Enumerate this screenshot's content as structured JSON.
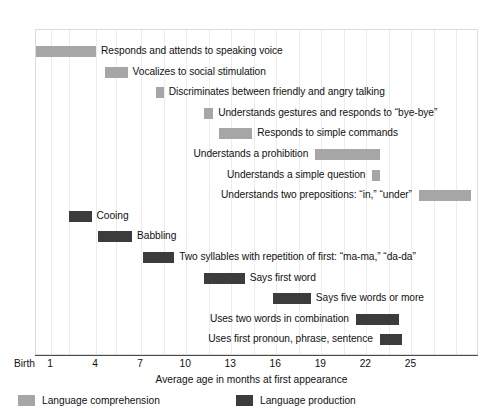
{
  "chart_data": {
    "type": "bar",
    "title": "",
    "subtitle": "",
    "xlabel": "Average age in months at first appearance",
    "ylabel": "",
    "xlim": [
      0,
      29.5
    ],
    "grid": true,
    "orientation": "horizontal",
    "legend_position": "bottom-left",
    "xtick_labels": [
      "Birth",
      "1",
      "4",
      "7",
      "10",
      "13",
      "16",
      "19",
      "22",
      "25"
    ],
    "xtick_values": [
      0,
      1,
      4,
      7,
      10,
      13,
      16,
      19,
      22,
      25
    ],
    "legend": [
      {
        "name": "Language comprehension",
        "color": "#a6a6a6"
      },
      {
        "name": "Language production",
        "color": "#3c3c3c"
      }
    ],
    "series": [
      {
        "name": "Language comprehension",
        "color": "#a6a6a6",
        "bars": [
          {
            "label": "Responds and attends to speaking voice",
            "start": 0.0,
            "end": 4.0,
            "label_side": "right"
          },
          {
            "label": "Vocalizes to social stimulation",
            "start": 4.6,
            "end": 6.1,
            "label_side": "right"
          },
          {
            "label": "Discriminates between friendly and angry talking",
            "start": 8.0,
            "end": 8.5,
            "label_side": "right"
          },
          {
            "label": "Understands gestures and responds to “bye-bye”",
            "start": 11.2,
            "end": 11.8,
            "label_side": "right"
          },
          {
            "label": "Responds to simple commands",
            "start": 12.2,
            "end": 14.4,
            "label_side": "right"
          },
          {
            "label": "Understands a prohibition",
            "start": 18.6,
            "end": 22.9,
            "label_side": "left"
          },
          {
            "label": "Understands a simple question",
            "start": 22.4,
            "end": 22.9,
            "label_side": "left"
          },
          {
            "label": "Understands two prepositions: “in,” “under”",
            "start": 25.5,
            "end": 29.0,
            "label_side": "left"
          }
        ]
      },
      {
        "name": "Language production",
        "color": "#3c3c3c",
        "bars": [
          {
            "label": "Cooing",
            "start": 2.2,
            "end": 3.7,
            "label_side": "right"
          },
          {
            "label": "Babbling",
            "start": 4.1,
            "end": 6.4,
            "label_side": "right"
          },
          {
            "label": "Two syllables with repetition of first: “ma-ma,” “da-da”",
            "start": 7.1,
            "end": 9.2,
            "label_side": "right"
          },
          {
            "label": "Says first word",
            "start": 11.2,
            "end": 13.9,
            "label_side": "right"
          },
          {
            "label": "Says five words or more",
            "start": 15.8,
            "end": 18.3,
            "label_side": "right"
          },
          {
            "label": "Uses two words in combination",
            "start": 21.3,
            "end": 24.2,
            "label_side": "left"
          },
          {
            "label": "Uses first pronoun, phrase, sentence",
            "start": 22.9,
            "end": 24.4,
            "label_side": "left"
          }
        ]
      }
    ],
    "rows": [
      {
        "label": "Responds and attends to speaking voice",
        "type": "comprehension",
        "start": 0.0,
        "end": 4.0,
        "label_side": "right"
      },
      {
        "label": "Vocalizes to social stimulation",
        "type": "comprehension",
        "start": 4.6,
        "end": 6.1,
        "label_side": "right"
      },
      {
        "label": "Discriminates between friendly and angry talking",
        "type": "comprehension",
        "start": 8.0,
        "end": 8.5,
        "label_side": "right"
      },
      {
        "label": "Understands gestures and responds to “bye-bye”",
        "type": "comprehension",
        "start": 11.2,
        "end": 11.8,
        "label_side": "right"
      },
      {
        "label": "Responds to simple commands",
        "type": "comprehension",
        "start": 12.2,
        "end": 14.4,
        "label_side": "right"
      },
      {
        "label": "Understands a prohibition",
        "type": "comprehension",
        "start": 18.6,
        "end": 22.9,
        "label_side": "left"
      },
      {
        "label": "Understands a simple question",
        "type": "comprehension",
        "start": 22.4,
        "end": 22.9,
        "label_side": "left"
      },
      {
        "label": "Understands two prepositions: “in,” “under”",
        "type": "comprehension",
        "start": 25.5,
        "end": 29.0,
        "label_side": "left"
      },
      {
        "label": "Cooing",
        "type": "production",
        "start": 2.2,
        "end": 3.7,
        "label_side": "right"
      },
      {
        "label": "Babbling",
        "type": "production",
        "start": 4.1,
        "end": 6.4,
        "label_side": "right"
      },
      {
        "label": "Two syllables with repetition of first: “ma-ma,” “da-da”",
        "type": "production",
        "start": 7.1,
        "end": 9.2,
        "label_side": "right"
      },
      {
        "label": "Says first word",
        "type": "production",
        "start": 11.2,
        "end": 13.9,
        "label_side": "right"
      },
      {
        "label": "Says five words or more",
        "type": "production",
        "start": 15.8,
        "end": 18.3,
        "label_side": "right"
      },
      {
        "label": "Uses two words in combination",
        "type": "production",
        "start": 21.3,
        "end": 24.2,
        "label_side": "left"
      },
      {
        "label": "Uses first pronoun, phrase, sentence",
        "type": "production",
        "start": 22.9,
        "end": 24.4,
        "label_side": "left"
      }
    ],
    "gridline_values": [
      1,
      2.2,
      4,
      5.3,
      7,
      8.5,
      10,
      11.5,
      13,
      14.5,
      16,
      17.5,
      19,
      20.5,
      22,
      23.5,
      25,
      26.5,
      28
    ]
  },
  "colors": {
    "comprehension": "#a6a6a6",
    "production": "#3c3c3c",
    "axis": "#4a4a4a",
    "grid": "#ececec",
    "frame": "#dcdcdc",
    "text": "#111111"
  }
}
